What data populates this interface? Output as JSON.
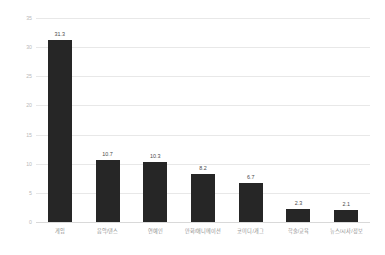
{
  "chart_data": {
    "type": "bar",
    "title": "",
    "xlabel": "",
    "ylabel": "",
    "categories": [
      "게임",
      "음악/댄스",
      "연예인",
      "만화/애니메이션",
      "코미디/개그",
      "학술/교육",
      "뉴스/시사/정보"
    ],
    "values": [
      31.3,
      10.7,
      10.3,
      8.2,
      6.7,
      2.3,
      2.1
    ],
    "value_labels": [
      "31.3",
      "10.7",
      "10.3",
      "8.2",
      "6.7",
      "2.3",
      "2.1"
    ],
    "ylim": [
      0,
      35
    ],
    "yticks": [
      35,
      30,
      25,
      20,
      15,
      10,
      5,
      0
    ],
    "ytick_labels": [
      "35",
      "30",
      "25",
      "20",
      "15",
      "10",
      "5",
      "0"
    ],
    "grid": true,
    "legend": false,
    "bar_color": "#262626",
    "grid_color": "#e8e8e8"
  }
}
